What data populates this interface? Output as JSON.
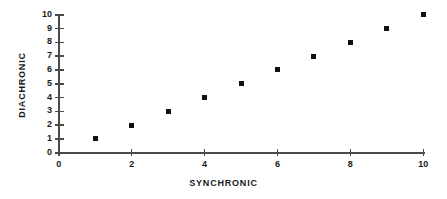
{
  "chart_data": {
    "type": "scatter",
    "title": "",
    "xlabel": "SYNCHRONIC",
    "ylabel": "DIACHRONIC",
    "xlim": [
      0,
      10
    ],
    "ylim": [
      0,
      10
    ],
    "grid": false,
    "legend": null,
    "x_ticks": [
      0,
      2,
      4,
      6,
      8,
      10
    ],
    "x_tick_labels": [
      "0",
      "2",
      "4",
      "6",
      "8",
      "10"
    ],
    "y_ticks": [
      0,
      1,
      2,
      3,
      4,
      5,
      6,
      7,
      8,
      9,
      10
    ],
    "y_tick_labels": [
      "0",
      "1",
      "2",
      "3",
      "4",
      "5",
      "6",
      "7",
      "8",
      "9",
      "10"
    ],
    "marker": "square",
    "marker_color": "#111111",
    "axis_color": "#4a4a4a",
    "background_color": "#ffffff",
    "x": [
      1,
      2,
      3,
      4,
      5,
      6,
      7,
      8,
      9,
      10
    ],
    "y": [
      1,
      2,
      3,
      4,
      5,
      6,
      7,
      8,
      9,
      10
    ],
    "points": [
      {
        "x": 1,
        "y": 1
      },
      {
        "x": 2,
        "y": 2
      },
      {
        "x": 3,
        "y": 3
      },
      {
        "x": 4,
        "y": 4
      },
      {
        "x": 5,
        "y": 5
      },
      {
        "x": 6,
        "y": 6
      },
      {
        "x": 7,
        "y": 7
      },
      {
        "x": 8,
        "y": 8
      },
      {
        "x": 9,
        "y": 9
      },
      {
        "x": 10,
        "y": 10
      }
    ]
  }
}
